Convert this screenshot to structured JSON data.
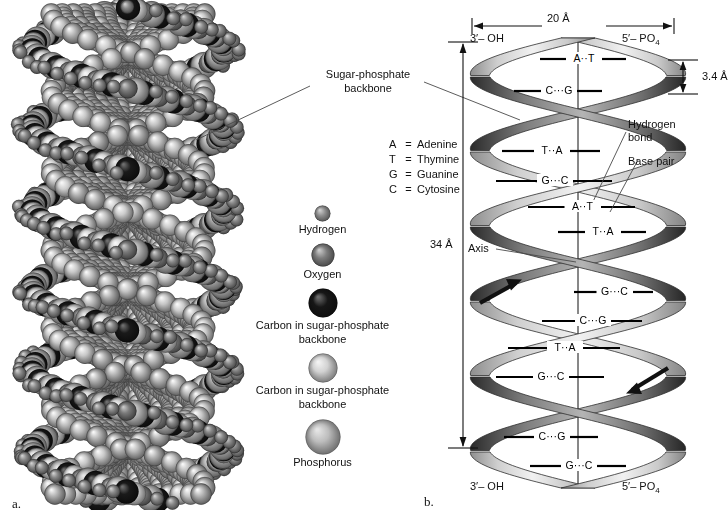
{
  "figure": {
    "panel_a_letter": "a.",
    "panel_b_letter": "b."
  },
  "callouts": {
    "sugar_phosphate_backbone": "Sugar-phosphate\nbackbone",
    "sugar_phosphate_line1": "Sugar-phosphate",
    "sugar_phosphate_line2": "backbone",
    "hydrogen_bond_line1": "Hydrogen",
    "hydrogen_bond_line2": "bond",
    "base_pair": "Base pair",
    "axis": "Axis"
  },
  "base_key": [
    {
      "symbol": "A",
      "equals": "=",
      "name": "Adenine"
    },
    {
      "symbol": "T",
      "equals": "=",
      "name": "Thymine"
    },
    {
      "symbol": "G",
      "equals": "=",
      "name": "Guanine"
    },
    {
      "symbol": "C",
      "equals": "=",
      "name": "Cytosine"
    }
  ],
  "legend": {
    "items": [
      {
        "label": "Hydrogen",
        "diameter": 17,
        "color": "#8e8e8e",
        "highlight": "#cfcfcf"
      },
      {
        "label": "Oxygen",
        "diameter": 24,
        "color": "#7d7d7d",
        "highlight": "#c8c8c8"
      },
      {
        "label": "Carbon in sugar-phosphate\nbackbone",
        "line1": "Carbon in sugar-phosphate",
        "line2": "backbone",
        "diameter": 30,
        "color": "#171717",
        "highlight": "#6a6a6a"
      },
      {
        "label": "Carbon in sugar-phosphate\nbackbone",
        "line1": "Carbon in sugar-phosphate",
        "line2": "backbone",
        "diameter": 30,
        "color": "#d2d2d2",
        "highlight": "#f2f2f2"
      },
      {
        "label": "Phosphorus",
        "diameter": 36,
        "color": "#bdbdbd",
        "highlight": "#e4e4e4"
      }
    ]
  },
  "helix": {
    "end_labels": {
      "top_left": "3′– OH",
      "top_right": "5′– PO",
      "top_right_sub": "4",
      "bottom_left": "3′– OH",
      "bottom_right": "5′– PO",
      "bottom_right_sub": "4"
    },
    "measurements": {
      "width": "20 Å",
      "rise": "3.4 Å",
      "pitch": "34 Å"
    },
    "base_pairs": [
      {
        "text": "A··T",
        "y": 59,
        "left": 110,
        "right": 196
      },
      {
        "text": "C···G",
        "y": 91,
        "left": 84,
        "right": 172
      },
      {
        "text": "T··A",
        "y": 151,
        "left": 72,
        "right": 170
      },
      {
        "text": "G···C",
        "y": 181,
        "left": 66,
        "right": 182
      },
      {
        "text": "A··T",
        "y": 207,
        "left": 98,
        "right": 205
      },
      {
        "text": "T··A",
        "y": 232,
        "left": 128,
        "right": 216
      },
      {
        "text": "G···C",
        "y": 292,
        "left": 144,
        "right": 223
      },
      {
        "text": "C···G",
        "y": 321,
        "left": 112,
        "right": 212
      },
      {
        "text": "T··A",
        "y": 348,
        "left": 78,
        "right": 190
      },
      {
        "text": "G···C",
        "y": 377,
        "left": 66,
        "right": 174
      },
      {
        "text": "C···G",
        "y": 437,
        "left": 74,
        "right": 168
      },
      {
        "text": "G···C",
        "y": 466,
        "left": 100,
        "right": 196
      }
    ],
    "strand_arrows": [
      {
        "name": "upward-arrow",
        "direction": "up-right"
      },
      {
        "name": "downward-arrow",
        "direction": "down-left"
      }
    ]
  },
  "colors": {
    "ribbon_light": "#e9e9e9",
    "ribbon_mid": "#a8a8a8",
    "ribbon_dark": "#3a3a3a",
    "line": "#111111",
    "background": "#ffffff"
  }
}
